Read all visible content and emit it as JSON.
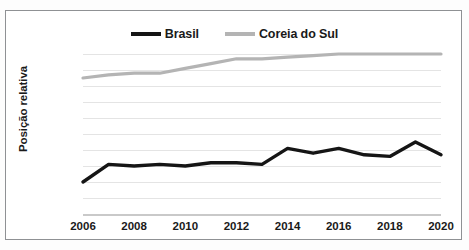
{
  "legend": {
    "position": "top-center",
    "entries": [
      {
        "label": "Brasil",
        "color": "#151515"
      },
      {
        "label": "Coreia do Sul",
        "color": "#b4b4b4"
      }
    ]
  },
  "axes": {
    "ylabel": "Posição relativa",
    "ytick_labels": [
      "100%",
      "90%",
      "80%",
      "70%",
      "60%",
      "50%",
      "40%",
      "30%",
      "20%",
      "10%",
      "0%"
    ],
    "xtick_labels": [
      "2006",
      "2008",
      "2010",
      "2012",
      "2014",
      "2016",
      "2018",
      "2020"
    ]
  },
  "colors": {
    "brasil": "#151515",
    "coreia": "#b4b4b4",
    "gridline": "#e4e4e4",
    "frame": "#8f9194",
    "axis": "#c9c9c9",
    "text": "#1a1a1a",
    "background": "#ffffff"
  },
  "chart_data": {
    "type": "line",
    "title": "",
    "subtitle": "",
    "xlabel": "",
    "ylabel": "Posição relativa",
    "xlim": [
      2006,
      2020
    ],
    "ylim": [
      0,
      100
    ],
    "ytick_values": [
      0,
      10,
      20,
      30,
      40,
      50,
      60,
      70,
      80,
      90,
      100
    ],
    "ytick_labels": [
      "0%",
      "10%",
      "20%",
      "30%",
      "40%",
      "50%",
      "60%",
      "70%",
      "80%",
      "90%",
      "100%"
    ],
    "xtick_values": [
      2006,
      2008,
      2010,
      2012,
      2014,
      2016,
      2018,
      2020
    ],
    "xtick_labels": [
      "2006",
      "2008",
      "2010",
      "2012",
      "2014",
      "2016",
      "2018",
      "2020"
    ],
    "grid": "horizontal",
    "legend_position": "top-center",
    "value_unit": "percent",
    "x": [
      2006,
      2007,
      2008,
      2009,
      2010,
      2011,
      2012,
      2013,
      2014,
      2015,
      2016,
      2017,
      2018,
      2019,
      2020
    ],
    "series": [
      {
        "name": "Brasil",
        "color": "#151515",
        "values": [
          20,
          31,
          30,
          31,
          30,
          32,
          32,
          31,
          41,
          38,
          41,
          37,
          36,
          45,
          37
        ]
      },
      {
        "name": "Coreia do Sul",
        "color": "#b4b4b4",
        "values": [
          85,
          87,
          88,
          88,
          91,
          94,
          97,
          97,
          98,
          99,
          100,
          100,
          100,
          100,
          100
        ]
      }
    ]
  }
}
